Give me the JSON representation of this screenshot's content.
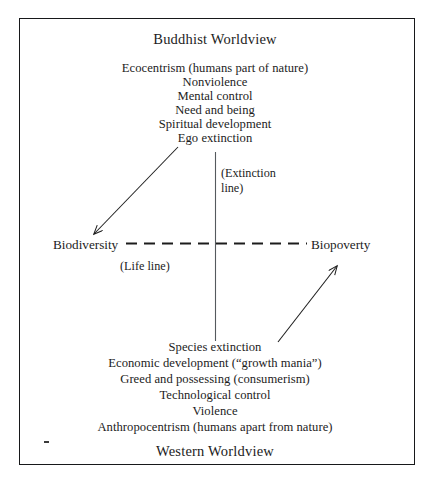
{
  "figure": {
    "top_heading": "Buddhist Worldview",
    "bottom_heading": "Western Worldview",
    "top_list": [
      "Ecocentrism (humans part of nature)",
      "Nonviolence",
      "Mental control",
      "Need and being",
      "Spiritual development",
      "Ego extinction"
    ],
    "bottom_list": [
      "Species extinction",
      "Economic development (“growth mania”)",
      "Greed and possessing (consumerism)",
      "Technological control",
      "Violence",
      "Anthropocentrism (humans apart from nature)"
    ],
    "axis_left_label": "Biodiversity",
    "axis_right_label": "Biopoverty",
    "life_line_label": "(Life line)",
    "extinction_line_label_1": "(Extinction",
    "extinction_line_label_2": "line)",
    "ink_color": "#1c1c1c",
    "frame_color": "#17181a",
    "background_color": "#ffffff"
  }
}
